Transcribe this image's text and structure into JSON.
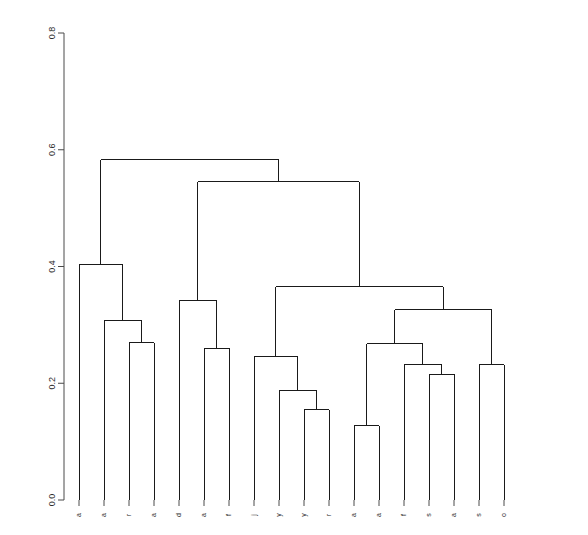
{
  "chart_data": {
    "type": "dendrogram",
    "title": "",
    "xlabel": "",
    "ylabel": "",
    "ylim": [
      0.0,
      0.85
    ],
    "grid": false,
    "legend": null,
    "orientation": "vertical",
    "axis": {
      "tick_values": [
        0.0,
        0.2,
        0.4,
        0.6,
        0.8
      ],
      "tick_labels": [
        "0.0",
        "0.2",
        "0.4",
        "0.6",
        "0.8"
      ],
      "side": "left",
      "label_rotation": -90
    },
    "leaf_count": 18,
    "leaf_labels": [
      "a",
      "a",
      "r",
      "a",
      "d",
      "a",
      "f",
      "j",
      "y",
      "y",
      "r",
      "a",
      "a",
      "f",
      "s",
      "a",
      "s",
      "o",
      "c",
      "e"
    ],
    "leaves": [
      {
        "index": 1,
        "label": "a",
        "x": 79
      },
      {
        "index": 2,
        "label": "a",
        "x": 104
      },
      {
        "index": 3,
        "label": "r",
        "x": 129
      },
      {
        "index": 4,
        "label": "a",
        "x": 154
      },
      {
        "index": 5,
        "label": "d",
        "x": 179
      },
      {
        "index": 6,
        "label": "a",
        "x": 204
      },
      {
        "index": 7,
        "label": "f",
        "x": 229
      },
      {
        "index": 8,
        "label": "j",
        "x": 254
      },
      {
        "index": 9,
        "label": "y",
        "x": 279
      },
      {
        "index": 10,
        "label": "y",
        "x": 304
      },
      {
        "index": 11,
        "label": "r",
        "x": 329
      },
      {
        "index": 12,
        "label": "a",
        "x": 354
      },
      {
        "index": 13,
        "label": "a",
        "x": 379
      },
      {
        "index": 14,
        "label": "f",
        "x": 404
      },
      {
        "index": 15,
        "label": "s",
        "x": 429
      },
      {
        "index": 16,
        "label": "a",
        "x": 454
      },
      {
        "index": 17,
        "label": "s",
        "x": 479
      },
      {
        "index": 18,
        "label": "o",
        "x": 504
      }
    ],
    "merges": [
      {
        "id": "m1",
        "height": 0.269,
        "left": "leaf3",
        "right": "leaf4"
      },
      {
        "id": "m2",
        "height": 0.307,
        "left": "leaf2",
        "right": "m1"
      },
      {
        "id": "m3",
        "height": 0.404,
        "left": "leaf1",
        "right": "m2"
      },
      {
        "id": "m4",
        "height": 0.26,
        "left": "leaf6",
        "right": "leaf7"
      },
      {
        "id": "m5",
        "height": 0.342,
        "left": "leaf5",
        "right": "m4"
      },
      {
        "id": "m6",
        "height": 0.155,
        "left": "leaf10",
        "right": "leaf11"
      },
      {
        "id": "m7",
        "height": 0.188,
        "left": "leaf9",
        "right": "m6"
      },
      {
        "id": "m8",
        "height": 0.245,
        "left": "leaf8",
        "right": "m7"
      },
      {
        "id": "m9",
        "height": 0.127,
        "left": "leaf12",
        "right": "leaf13"
      },
      {
        "id": "m10",
        "height": 0.215,
        "left": "leaf15",
        "right": "leaf16"
      },
      {
        "id": "m11",
        "height": 0.232,
        "left": "leaf14",
        "right": "m10"
      },
      {
        "id": "m12",
        "height": 0.268,
        "left": "m9",
        "right": "m11"
      },
      {
        "id": "m13",
        "height": 0.232,
        "left": "leaf17",
        "right": "leaf18"
      },
      {
        "id": "m14",
        "height": 0.326,
        "left": "m12",
        "right": "m13"
      },
      {
        "id": "m15",
        "height": 0.365,
        "left": "m8",
        "right": "m14"
      },
      {
        "id": "m16",
        "height": 0.545,
        "left": "m5",
        "right": "m15"
      },
      {
        "id": "m17",
        "height": 0.583,
        "left": "m3",
        "right": "m16"
      }
    ],
    "colors": {
      "line": "#1a1a1a",
      "axis": "#4a4a4a",
      "background": "#ffffff"
    }
  },
  "geometry": {
    "plot_left": 64,
    "plot_right": 576,
    "axis_x": 64,
    "y_zero_px": 500,
    "y_top_px": 33,
    "y_top_value": 0.8,
    "leaf_spacing": 25,
    "first_leaf_x": 79,
    "tick_len": 6,
    "line_width": 1
  }
}
